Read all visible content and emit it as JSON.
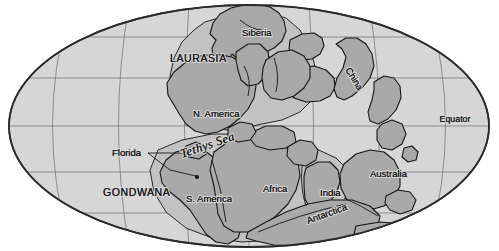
{
  "figure": {
    "name": "pangaea-map",
    "background_color": "#ffffff",
    "ocean_color": "#d6d6d6",
    "land_color": "#a9a9a9",
    "shelf_color": "#c2c2c2",
    "outline_color": "#2b2b2b",
    "graticule_color": "#6e6e6e",
    "text_color": "#1a1a1a"
  },
  "labels": {
    "supercontinents": [
      {
        "id": "laurasia",
        "text": "LAURASIA",
        "x": 170,
        "y": 62,
        "rotate": 0
      },
      {
        "id": "gondwana",
        "text": "GONDWANA",
        "x": 103,
        "y": 196,
        "rotate": 0
      }
    ],
    "continents": [
      {
        "id": "siberia",
        "text": "Siberia",
        "x": 242,
        "y": 36,
        "rotate": 0
      },
      {
        "id": "china",
        "text": "China",
        "x": 345,
        "y": 70,
        "rotate": 58
      },
      {
        "id": "north-america",
        "text": "N. America",
        "x": 193,
        "y": 117,
        "rotate": 0
      },
      {
        "id": "south-america",
        "text": "S. America",
        "x": 186,
        "y": 202,
        "rotate": 0
      },
      {
        "id": "africa",
        "text": "Africa",
        "x": 263,
        "y": 192,
        "rotate": 0
      },
      {
        "id": "india",
        "text": "India",
        "x": 320,
        "y": 196,
        "rotate": 0
      },
      {
        "id": "australia",
        "text": "Australia",
        "x": 370,
        "y": 177,
        "rotate": 0
      },
      {
        "id": "antarctica",
        "text": "Antarctica",
        "x": 308,
        "y": 224,
        "rotate": -20
      }
    ],
    "oceans": [
      {
        "id": "tethys-sea",
        "text": "Tethys Sea",
        "x": 182,
        "y": 158,
        "rotate": -19
      }
    ],
    "annotations": [
      {
        "id": "florida",
        "text": "Florida",
        "x": 112,
        "y": 156,
        "rotate": 0
      },
      {
        "id": "equator",
        "text": "Equator",
        "x": 455,
        "y": 122,
        "rotate": 0
      }
    ]
  },
  "graticule": {
    "parallels": [
      {
        "id": "lat-60n",
        "y": 37
      },
      {
        "id": "lat-30n",
        "y": 78
      },
      {
        "id": "equator",
        "y": 126
      },
      {
        "id": "lat-30s",
        "y": 172
      },
      {
        "id": "lat-60s",
        "y": 213
      }
    ],
    "meridian_count": 7,
    "equator_y": 126
  },
  "projection": {
    "center_x": 249,
    "center_y": 126,
    "radius_x": 241,
    "radius_y": 122
  }
}
